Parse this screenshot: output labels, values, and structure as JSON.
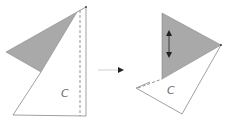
{
  "diagram": {
    "left_figure": {
      "label": "C",
      "fill_color": "#a9a9a9"
    },
    "right_figure": {
      "label": "C",
      "fill_color": "#a9a9a9"
    },
    "transition_arrow": {
      "direction": "right"
    },
    "motion_indicator": {
      "type": "double-headed vertical arrow"
    }
  }
}
